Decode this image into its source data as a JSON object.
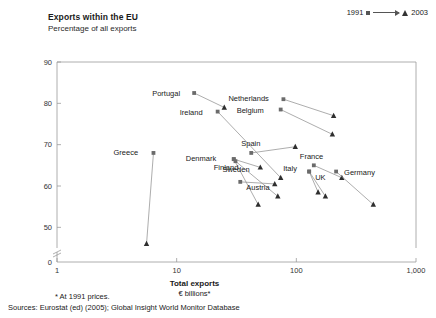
{
  "header": {
    "title": "Exports within the EU",
    "subtitle": "Percentage of all exports"
  },
  "legend": {
    "start_label": "1991",
    "end_label": "2003",
    "start_marker": "square-marker",
    "end_marker": "triangle-marker"
  },
  "footnotes": {
    "note": "* At 1991 prices.",
    "sources": "Sources: Eurostat (ed) (2005); Global Insight World Monitor Database"
  },
  "chart_data": {
    "type": "scatter",
    "title": "Exports within the EU",
    "subtitle": "Percentage of all exports",
    "xlabel": "Total exports",
    "xlabel_sub": "€ billions*",
    "ylabel": "Percentage of all exports",
    "xscale": "log",
    "xlim": [
      1,
      1000
    ],
    "ylim": [
      45,
      90
    ],
    "yaxis_break": true,
    "ybreak_note": "axis broken between 0 and 45",
    "xticks": [
      "1",
      "10",
      "100",
      "1,000"
    ],
    "xtick_values": [
      1,
      10,
      100,
      1000
    ],
    "yticks": [
      "0",
      "50",
      "60",
      "70",
      "80",
      "90"
    ],
    "ytick_values": [
      0,
      50,
      60,
      70,
      80,
      90
    ],
    "grid": false,
    "legend_position": "top-right",
    "series_start_year": 1991,
    "series_end_year": 2003,
    "points": [
      {
        "name": "Portugal",
        "x_1991": 14.0,
        "y_1991": 82.5,
        "x_2003": 25.0,
        "y_2003": 79.0,
        "label_dx": -42,
        "label_dy": 3
      },
      {
        "name": "Ireland",
        "x_1991": 22.0,
        "y_1991": 78.0,
        "x_2003": 74.0,
        "y_2003": 62.0,
        "label_dx": -38,
        "label_dy": 3
      },
      {
        "name": "Netherlands",
        "x_1991": 78.0,
        "y_1991": 81.0,
        "x_2003": 205.0,
        "y_2003": 77.0,
        "label_dx": -55,
        "label_dy": 2
      },
      {
        "name": "Belgium",
        "x_1991": 74.0,
        "y_1991": 78.5,
        "x_2003": 200.0,
        "y_2003": 72.5,
        "label_dx": -44,
        "label_dy": 3
      },
      {
        "name": "Spain",
        "x_1991": 42.0,
        "y_1991": 68.0,
        "x_2003": 98.0,
        "y_2003": 69.5,
        "label_dx": -10,
        "label_dy": -7
      },
      {
        "name": "Denmark",
        "x_1991": 30.0,
        "y_1991": 66.5,
        "x_2003": 50.0,
        "y_2003": 64.5,
        "label_dx": -48,
        "label_dy": 2
      },
      {
        "name": "Austria",
        "x_1991": 34.0,
        "y_1991": 61.0,
        "x_2003": 66.0,
        "y_2003": 60.5,
        "label_dx": 6,
        "label_dy": 8
      },
      {
        "name": "France",
        "x_1991": 140.0,
        "y_1991": 65.0,
        "x_2003": 240.0,
        "y_2003": 62.0,
        "label_dx": -14,
        "label_dy": -6
      },
      {
        "name": "Italy",
        "x_1991": 128.0,
        "y_1991": 63.5,
        "x_2003": 175.0,
        "y_2003": 57.5,
        "label_dx": -26,
        "label_dy": -1
      },
      {
        "name": "Germany",
        "x_1991": 215.0,
        "y_1991": 63.5,
        "x_2003": 440.0,
        "y_2003": 55.5,
        "label_dx": 8,
        "label_dy": 3
      },
      {
        "name": "UK",
        "x_1991": 128.0,
        "y_1991": 63.5,
        "x_2003": 152.0,
        "y_2003": 58.5,
        "label_dx": 6,
        "label_dy": 8
      },
      {
        "name": "Finland",
        "x_1991": 30.0,
        "y_1991": 66.5,
        "x_2003": 48.0,
        "y_2003": 55.5,
        "label_dx": -20,
        "label_dy": 11
      },
      {
        "name": "Sweden",
        "x_1991": 31.0,
        "y_1991": 66.0,
        "x_2003": 70.0,
        "y_2003": 57.5,
        "label_dx": -13,
        "label_dy": 11
      },
      {
        "name": "Greece",
        "x_1991": 6.4,
        "y_1991": 68.0,
        "x_2003": 5.6,
        "y_2003": 46.0,
        "label_dx": -40,
        "label_dy": 2
      }
    ]
  }
}
